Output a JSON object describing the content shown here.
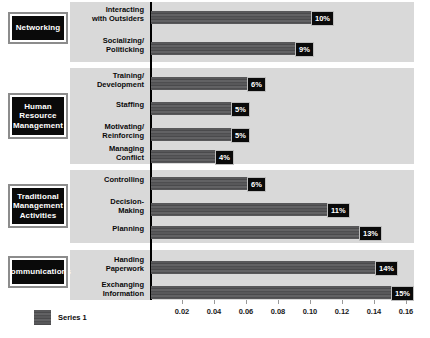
{
  "chart_data": {
    "type": "bar",
    "orientation": "horizontal",
    "title": "",
    "xlabel": "",
    "ylabel": "",
    "xlim": [
      0,
      0.16
    ],
    "xticks": [
      "0.02",
      "0.04",
      "0.06",
      "0.08",
      "0.10",
      "0.12",
      "0.14",
      "0.16"
    ],
    "xtick_values": [
      0.02,
      0.04,
      0.06,
      0.08,
      0.1,
      0.12,
      0.14,
      0.16
    ],
    "grid": false,
    "legend": {
      "position": "bottom-left",
      "entries": [
        "Series 1"
      ]
    },
    "series": [
      {
        "name": "Series 1",
        "color": "#58585a"
      }
    ],
    "groups": [
      {
        "name": "Networking",
        "categories": [
          "Interacting with Outsiders",
          "Socializing/ Politicking"
        ],
        "values": [
          0.1,
          0.09
        ],
        "labels": [
          "10%",
          "9%"
        ]
      },
      {
        "name": "Human Resource Management",
        "categories": [
          "Training/ Development",
          "Staffing",
          "Motivating/ Reinforcing",
          "Managing Conflict"
        ],
        "values": [
          0.06,
          0.05,
          0.05,
          0.04
        ],
        "labels": [
          "6%",
          "5%",
          "5%",
          "4%"
        ]
      },
      {
        "name": "Traditional Management Activities",
        "categories": [
          "Controlling",
          "Decision- Making",
          "Planning"
        ],
        "values": [
          0.06,
          0.11,
          0.13
        ],
        "labels": [
          "6%",
          "11%",
          "13%"
        ]
      },
      {
        "name": "Communications",
        "categories": [
          "Handing Paperwork",
          "Exchanging Information"
        ],
        "values": [
          0.14,
          0.15
        ],
        "labels": [
          "14%",
          "15%"
        ]
      }
    ],
    "categories": [
      "Interacting with Outsiders",
      "Socializing/ Politicking",
      "Training/ Development",
      "Staffing",
      "Motivating/ Reinforcing",
      "Managing Conflict",
      "Controlling",
      "Decision- Making",
      "Planning",
      "Handing Paperwork",
      "Exchanging Information"
    ],
    "values": [
      0.1,
      0.09,
      0.06,
      0.05,
      0.05,
      0.04,
      0.06,
      0.11,
      0.13,
      0.14,
      0.15
    ],
    "value_labels": [
      "10%",
      "9%",
      "6%",
      "5%",
      "5%",
      "4%",
      "6%",
      "11%",
      "13%",
      "14%",
      "15%"
    ]
  },
  "groups": [
    {
      "title_lines": [
        "Networking"
      ],
      "box": {
        "top": 14,
        "height": 28
      },
      "band": {
        "top": 2,
        "height": 60
      },
      "rows": [
        {
          "label_lines": [
            "Interacting",
            "with Outsiders"
          ],
          "top": 6,
          "value": 0.1,
          "tag": "10%"
        },
        {
          "label_lines": [
            "Socializing/",
            "Politicking"
          ],
          "top": 37,
          "value": 0.09,
          "tag": "9%"
        }
      ]
    },
    {
      "title_lines": [
        "Human",
        "Resource",
        "Management"
      ],
      "box": {
        "top": 95,
        "height": 42
      },
      "band": {
        "top": 68,
        "height": 96
      },
      "rows": [
        {
          "label_lines": [
            "Training/",
            "Development"
          ],
          "top": 72,
          "value": 0.06,
          "tag": "6%"
        },
        {
          "label_lines": [
            "Staffing"
          ],
          "top": 101,
          "value": 0.05,
          "tag": "5%"
        },
        {
          "label_lines": [
            "Motivating/",
            "Reinforcing"
          ],
          "top": 123,
          "value": 0.05,
          "tag": "5%"
        },
        {
          "label_lines": [
            "Managing",
            "Conflict"
          ],
          "top": 145,
          "value": 0.04,
          "tag": "4%"
        }
      ]
    },
    {
      "title_lines": [
        "Traditional",
        "Management",
        "Activities"
      ],
      "box": {
        "top": 186,
        "height": 40
      },
      "band": {
        "top": 170,
        "height": 73
      },
      "rows": [
        {
          "label_lines": [
            "Controlling"
          ],
          "top": 176,
          "value": 0.06,
          "tag": "6%"
        },
        {
          "label_lines": [
            "Decision-",
            "Making"
          ],
          "top": 198,
          "value": 0.11,
          "tag": "11%"
        },
        {
          "label_lines": [
            "Planning"
          ],
          "top": 225,
          "value": 0.13,
          "tag": "13%"
        }
      ]
    },
    {
      "title_lines": [
        "Communications"
      ],
      "box": {
        "top": 258,
        "height": 28
      },
      "band": {
        "top": 250,
        "height": 50
      },
      "rows": [
        {
          "label_lines": [
            "Handing",
            "Paperwork"
          ],
          "top": 256,
          "value": 0.14,
          "tag": "14%"
        },
        {
          "label_lines": [
            "Exchanging",
            "Information"
          ],
          "top": 281,
          "value": 0.15,
          "tag": "15%"
        }
      ]
    }
  ],
  "legend": {
    "label": "Series 1"
  },
  "axis": {
    "ticks": [
      {
        "label": "0.02",
        "value": 0.02
      },
      {
        "label": "0.04",
        "value": 0.04
      },
      {
        "label": "0.06",
        "value": 0.06
      },
      {
        "label": "0.08",
        "value": 0.08
      },
      {
        "label": "0.10",
        "value": 0.1
      },
      {
        "label": "0.12",
        "value": 0.12
      },
      {
        "label": "0.14",
        "value": 0.14
      },
      {
        "label": "0.16",
        "value": 0.16
      }
    ],
    "max": 0.16
  },
  "colors": {
    "band": "#d9d9d9",
    "bar": "#58585a",
    "box_bg": "#0a0a0a",
    "box_text": "#ffffff",
    "tag_bg": "#0a0a0a",
    "axis": "#000000"
  }
}
